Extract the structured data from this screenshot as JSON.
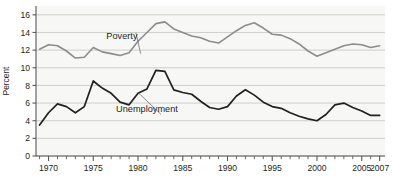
{
  "chart_data": {
    "type": "line",
    "title": "",
    "subtitle": "",
    "xlabel": "",
    "ylabel": "Percent",
    "xlim": [
      1968.6,
      2007.6
    ],
    "ylim": [
      0,
      17
    ],
    "grid": true,
    "grid_axis": "y",
    "legend": "inline-annotations",
    "legend_position": "inline",
    "x_tick_step": 1,
    "x_label_step": 5,
    "y_tick_step": 2,
    "xticklabels": [
      "1970",
      "1975",
      "1980",
      "1985",
      "1990",
      "1995",
      "2000",
      "2005",
      "2007"
    ],
    "xticklabel_values": [
      1970,
      1975,
      1980,
      1985,
      1990,
      1995,
      2000,
      2005,
      2007
    ],
    "yticklabels": [
      "0",
      "2",
      "4",
      "6",
      "8",
      "10",
      "12",
      "14",
      "16"
    ],
    "yticklabel_values": [
      0,
      2,
      4,
      6,
      8,
      10,
      12,
      14,
      16
    ],
    "x": [
      1969,
      1970,
      1971,
      1972,
      1973,
      1974,
      1975,
      1976,
      1977,
      1978,
      1979,
      1980,
      1981,
      1982,
      1983,
      1984,
      1985,
      1986,
      1987,
      1988,
      1989,
      1990,
      1991,
      1992,
      1993,
      1994,
      1995,
      1996,
      1997,
      1998,
      1999,
      2000,
      2001,
      2002,
      2003,
      2004,
      2005,
      2006,
      2007
    ],
    "series": [
      {
        "name": "Poverty",
        "color": "#8c8c8c",
        "width": 1.6,
        "label_x": 1978.2,
        "label_y": 13.3,
        "leader_to_x": 1980.3,
        "leader_to_y": 11.6,
        "values": [
          12.1,
          12.6,
          12.5,
          11.9,
          11.1,
          11.2,
          12.3,
          11.8,
          11.6,
          11.4,
          11.7,
          13.0,
          14.0,
          15.0,
          15.2,
          14.4,
          14.0,
          13.6,
          13.4,
          13.0,
          12.8,
          13.5,
          14.2,
          14.8,
          15.1,
          14.5,
          13.8,
          13.7,
          13.3,
          12.7,
          11.9,
          11.3,
          11.7,
          12.1,
          12.5,
          12.7,
          12.6,
          12.3,
          12.5
        ]
      },
      {
        "name": "Unemployment",
        "color": "#231f20",
        "width": 1.7,
        "label_x": 1981.0,
        "label_y": 5.0,
        "leader_to_x": 1980.1,
        "leader_to_y": 7.1,
        "values": [
          3.5,
          4.9,
          5.9,
          5.6,
          4.9,
          5.6,
          8.5,
          7.7,
          7.1,
          6.1,
          5.8,
          7.1,
          7.6,
          9.7,
          9.6,
          7.5,
          7.2,
          7.0,
          6.2,
          5.5,
          5.3,
          5.6,
          6.8,
          7.5,
          6.9,
          6.1,
          5.6,
          5.4,
          4.9,
          4.5,
          4.2,
          4.0,
          4.7,
          5.8,
          6.0,
          5.5,
          5.1,
          4.6,
          4.6
        ]
      }
    ]
  },
  "axes": {
    "ylabel": "Percent"
  }
}
